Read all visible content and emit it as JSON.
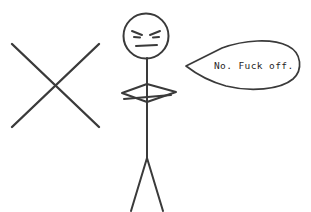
{
  "scene": {
    "title": "Angry stick figure refusing",
    "background_color": "#ffffff",
    "ink_color": "#3a3a3a",
    "text_color": "#1f1f1f",
    "width": 311,
    "height": 212
  },
  "mark": {
    "name": "cross-out X mark",
    "label": "X",
    "description": "Large hand-drawn X / cross shape on the left side",
    "stroke_1": "M 12,44 L 99,127",
    "stroke_2": "M 99,44 L 12,127"
  },
  "figure": {
    "name": "stick figure",
    "mood": "angry",
    "head": {
      "label": "head",
      "cx": 146,
      "cy": 36,
      "rx": 22.5,
      "ry": 22.5
    },
    "face": {
      "label": "angry face",
      "left_eyebrow": "M 132,31 L 142,35",
      "right_eyebrow": "M 160,31 L 150,35",
      "left_eye": "M 134,37 L 140,37.5",
      "right_eye": "M 153,37.5 L 159,37",
      "mouth": "M 136,46 L 157,45"
    },
    "torso": {
      "label": "torso and neck",
      "path": "M 147,58 L 147,158"
    },
    "arms": {
      "label": "folded arms",
      "diamond": "M 147,84 L 176,92 L 147,102 L 122,93 Z",
      "cross_stroke": "M 124,99 L 171,95"
    },
    "legs": {
      "label": "legs",
      "left": "M 147,158 L 131,211",
      "right": "M 147,158 L 163,211"
    }
  },
  "speech_bubble": {
    "name": "speech bubble",
    "text": "No. Fuck off.",
    "tail_tip_x": 186,
    "tail_tip_y": 66,
    "outline": "M 186,66 L 222,48 C 244,40 272,38 288,46 C 302,53 303,70 293,79 C 280,90 250,92 226,86 C 208,81 195,73 186,66 Z",
    "text_x": 214,
    "text_y": 69
  }
}
